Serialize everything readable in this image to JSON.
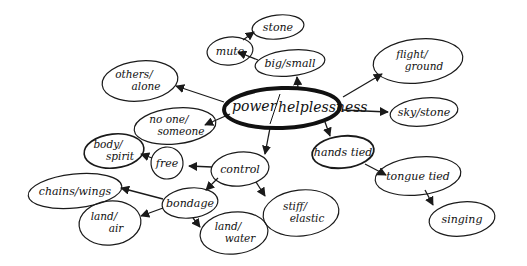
{
  "diagram": {
    "type": "mind-map",
    "background": "#ffffff",
    "ink_color": "#1a1a1a",
    "central_node": {
      "id": "power_helplessness",
      "label_top": "power/",
      "label_bottom": "helplessness",
      "label": "power/helplessness",
      "cx": 282,
      "cy": 108,
      "rx": 58,
      "ry": 20,
      "stroke_width": 4
    },
    "nodes": [
      {
        "id": "stone_top",
        "label": "stone",
        "lines": [
          "stone"
        ],
        "cx": 278,
        "cy": 27,
        "rx": 26,
        "ry": 12
      },
      {
        "id": "mute",
        "label": "mute",
        "lines": [
          "mute"
        ],
        "cx": 230,
        "cy": 51,
        "rx": 23,
        "ry": 14
      },
      {
        "id": "big_small",
        "label": "big/small",
        "lines": [
          "big/small"
        ],
        "cx": 290,
        "cy": 63,
        "rx": 35,
        "ry": 13
      },
      {
        "id": "others_alone",
        "label": "others/alone",
        "lines": [
          "others/",
          "alone"
        ],
        "cx": 140,
        "cy": 81,
        "rx": 38,
        "ry": 20
      },
      {
        "id": "no_one_someone",
        "label": "no one/someone",
        "lines": [
          "no one/",
          "someone"
        ],
        "cx": 175,
        "cy": 126,
        "rx": 41,
        "ry": 18
      },
      {
        "id": "flight_ground",
        "label": "flight/ground",
        "lines": [
          "flight/",
          "ground"
        ],
        "cx": 418,
        "cy": 61,
        "rx": 45,
        "ry": 22
      },
      {
        "id": "sky_stone",
        "label": "sky/stone",
        "lines": [
          "sky/stone"
        ],
        "cx": 424,
        "cy": 112,
        "rx": 34,
        "ry": 14
      },
      {
        "id": "hands_tied",
        "label": "hands tied",
        "lines": [
          "hands tied"
        ],
        "cx": 343,
        "cy": 152,
        "rx": 31,
        "ry": 16,
        "stroke_width": 1.8
      },
      {
        "id": "tongue_tied",
        "label": "tongue tied",
        "lines": [
          "tongue tied"
        ],
        "cx": 418,
        "cy": 176,
        "rx": 43,
        "ry": 19
      },
      {
        "id": "singing",
        "label": "singing",
        "lines": [
          "singing"
        ],
        "cx": 462,
        "cy": 219,
        "rx": 33,
        "ry": 17
      },
      {
        "id": "control",
        "label": "control",
        "lines": [
          "control"
        ],
        "cx": 240,
        "cy": 169,
        "rx": 29,
        "ry": 17
      },
      {
        "id": "body_spirit",
        "label": "body/spirit",
        "lines": [
          "body/",
          "spirit"
        ],
        "cx": 114,
        "cy": 151,
        "rx": 30,
        "ry": 17,
        "stroke_width": 1.6
      },
      {
        "id": "free",
        "label": "free",
        "lines": [
          "free"
        ],
        "cx": 167,
        "cy": 163,
        "rx": 16,
        "ry": 16
      },
      {
        "id": "chains_wings",
        "label": "chains/wings",
        "lines": [
          "chains/wings"
        ],
        "cx": 75,
        "cy": 191,
        "rx": 47,
        "ry": 17
      },
      {
        "id": "bondage",
        "label": "bondage",
        "lines": [
          "bondage"
        ],
        "cx": 190,
        "cy": 203,
        "rx": 28,
        "ry": 15
      },
      {
        "id": "land_air",
        "label": "land/air",
        "lines": [
          "land/",
          "air"
        ],
        "cx": 110,
        "cy": 223,
        "rx": 31,
        "ry": 22
      },
      {
        "id": "land_water",
        "label": "land/water",
        "lines": [
          "land/",
          "water"
        ],
        "cx": 234,
        "cy": 233,
        "rx": 34,
        "ry": 21
      },
      {
        "id": "stiff_elastic",
        "label": "stiff/elastic",
        "lines": [
          "stiff/",
          "elastic"
        ],
        "cx": 301,
        "cy": 213,
        "rx": 38,
        "ry": 23
      }
    ],
    "edges": [
      {
        "from": "power_helplessness",
        "to": "big_small",
        "x1": 298,
        "y1": 88,
        "x2": 297,
        "y2": 77
      },
      {
        "from": "big_small",
        "to": "mute",
        "x1": 258,
        "y1": 60,
        "x2": 238,
        "y2": 52
      },
      {
        "from": "mute",
        "to": "stone_top",
        "x1": 243,
        "y1": 40,
        "x2": 254,
        "y2": 32
      },
      {
        "from": "power_helplessness",
        "to": "others_alone",
        "x1": 224,
        "y1": 102,
        "x2": 176,
        "y2": 86
      },
      {
        "from": "power_helplessness",
        "to": "no_one_someone",
        "x1": 230,
        "y1": 114,
        "x2": 205,
        "y2": 125
      },
      {
        "from": "power_helplessness",
        "to": "flight_ground",
        "x1": 343,
        "y1": 97,
        "x2": 382,
        "y2": 74
      },
      {
        "from": "power_helplessness",
        "to": "sky_stone",
        "x1": 342,
        "y1": 110,
        "x2": 388,
        "y2": 112
      },
      {
        "from": "power_helplessness",
        "to": "hands_tied",
        "x1": 325,
        "y1": 122,
        "x2": 330,
        "y2": 136
      },
      {
        "from": "hands_tied",
        "to": "tongue_tied",
        "x1": 365,
        "y1": 164,
        "x2": 386,
        "y2": 175
      },
      {
        "from": "tongue_tied",
        "to": "singing",
        "x1": 425,
        "y1": 190,
        "x2": 433,
        "y2": 205
      },
      {
        "from": "power_helplessness",
        "to": "control",
        "x1": 270,
        "y1": 128,
        "x2": 265,
        "y2": 154
      },
      {
        "from": "control",
        "to": "free",
        "x1": 212,
        "y1": 167,
        "x2": 189,
        "y2": 166
      },
      {
        "from": "free",
        "to": "body_spirit",
        "x1": 152,
        "y1": 158,
        "x2": 141,
        "y2": 154
      },
      {
        "from": "control",
        "to": "bondage",
        "x1": 218,
        "y1": 178,
        "x2": 206,
        "y2": 190
      },
      {
        "from": "control",
        "to": "stiff_elastic",
        "x1": 256,
        "y1": 182,
        "x2": 265,
        "y2": 196
      },
      {
        "from": "bondage",
        "to": "chains_wings",
        "x1": 163,
        "y1": 199,
        "x2": 121,
        "y2": 188
      },
      {
        "from": "bondage",
        "to": "land_air",
        "x1": 163,
        "y1": 208,
        "x2": 141,
        "y2": 216
      },
      {
        "from": "bondage",
        "to": "land_water",
        "x1": 193,
        "y1": 218,
        "x2": 200,
        "y2": 227
      }
    ]
  }
}
